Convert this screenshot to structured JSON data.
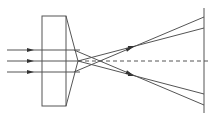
{
  "diagram": {
    "colors": {
      "line": "#555555",
      "arrow": "#333333",
      "background": "#ffffff"
    },
    "incident_rays": [
      {
        "y": 50,
        "x_start": 7,
        "x_end": 80,
        "arrow_x": 31
      },
      {
        "y": 61,
        "x_start": 7,
        "x_end": 78,
        "arrow_x": 31
      },
      {
        "y": 72,
        "x_start": 7,
        "x_end": 80,
        "arrow_x": 31
      }
    ],
    "slab": {
      "x": 42,
      "y": 16,
      "width": 24,
      "height": 90
    },
    "prism_face": {
      "top": [
        66,
        16
      ],
      "apex": [
        78,
        61
      ],
      "bottom": [
        66,
        106
      ]
    },
    "axis": {
      "y": 61,
      "x_start": 78,
      "x_end": 208,
      "style": "dashed"
    },
    "screen": {
      "x": 204,
      "y_top": 8,
      "y_bottom": 113
    },
    "refracted_rays": [
      {
        "from": [
          74,
          72
        ],
        "to": [
          204,
          17
        ],
        "arrow_at": 0.5
      },
      {
        "from": [
          78,
          61
        ],
        "to": [
          204,
          28
        ],
        "arrow_at": 0.5
      },
      {
        "from": [
          78,
          61
        ],
        "to": [
          204,
          94
        ],
        "arrow_at": 0.5
      },
      {
        "from": [
          74,
          50
        ],
        "to": [
          204,
          105
        ],
        "arrow_at": 0.5
      }
    ]
  }
}
